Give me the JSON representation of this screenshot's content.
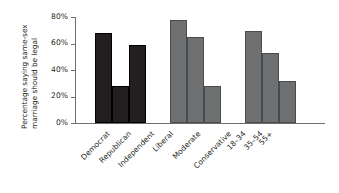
{
  "chart_data": {
    "type": "bar",
    "title": "",
    "subtitle": "",
    "xlabel": "",
    "ylabel": "Percentage saying same-sex marriage should be legal",
    "ylabel_lines": [
      "Percentage saying same-sex",
      "marriage should be legal"
    ],
    "ylim": [
      0,
      80
    ],
    "ytick_values": [
      0,
      20,
      40,
      60,
      80
    ],
    "ytick_labels": [
      "0%",
      "20%",
      "40%",
      "60%",
      "80%"
    ],
    "grid": false,
    "legend": "none",
    "categories": [
      "Democrat",
      "Republican",
      "Independent",
      "Liberal",
      "Moderate",
      "Conservative",
      "18–34",
      "35–54",
      "55+"
    ],
    "values": [
      68,
      28,
      59,
      78,
      65,
      28,
      70,
      53,
      32
    ],
    "groups": [
      {
        "name": "Party identification",
        "color": "#231f20",
        "categories": [
          "Democrat",
          "Republican",
          "Independent"
        ],
        "values": [
          68,
          28,
          59
        ]
      },
      {
        "name": "Political ideology",
        "color": "#6f7072",
        "categories": [
          "Liberal",
          "Moderate",
          "Conservative"
        ],
        "values": [
          78,
          65,
          28
        ]
      },
      {
        "name": "Age group",
        "color": "#6f7072",
        "categories": [
          "18–34",
          "35–54",
          "55+"
        ],
        "values": [
          70,
          53,
          32
        ]
      }
    ],
    "colors": {
      "dark_bar": "#231f20",
      "gray_bar": "#6f7072",
      "axis": "#6d6e71",
      "text": "#231f20",
      "background": "#ffffff"
    }
  }
}
